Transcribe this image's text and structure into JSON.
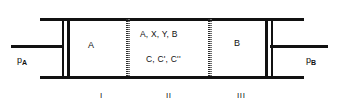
{
  "figure": {
    "type": "membrane-reactor-schematic",
    "line_color": "#111111",
    "membrane_color": "#2b2b2b",
    "background_color": "#ffffff"
  },
  "inlet": {
    "pressure_symbol": "p",
    "pressure_subscript": "A"
  },
  "outlet": {
    "pressure_symbol": "p",
    "pressure_subscript": "B"
  },
  "zones": [
    {
      "numeral": "I",
      "species": "A"
    },
    {
      "numeral": "II",
      "species_line_1": "A, X, Y, B",
      "species_line_2": "C, C', C''"
    },
    {
      "numeral": "III",
      "species": "B"
    }
  ]
}
